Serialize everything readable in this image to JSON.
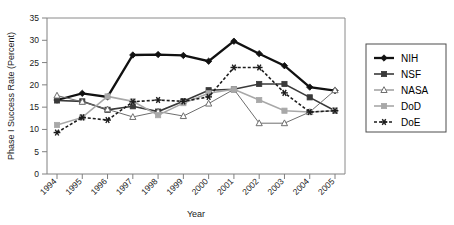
{
  "chart_data": {
    "type": "line",
    "title": "",
    "xlabel": "Year",
    "ylabel": "Phase I Success Rate (Percent)",
    "categories": [
      "1994",
      "1995",
      "1996",
      "1997",
      "1998",
      "1999",
      "2000",
      "2001",
      "2002",
      "2003",
      "2004",
      "2005"
    ],
    "x": [
      1994,
      1995,
      1996,
      1997,
      1998,
      1999,
      2000,
      2001,
      2002,
      2003,
      2004,
      2005
    ],
    "ylim": [
      0,
      35
    ],
    "yticks": [
      0,
      5,
      10,
      15,
      20,
      25,
      30,
      35
    ],
    "grid": false,
    "legend_position": "right",
    "series": [
      {
        "name": "NIH",
        "color": "#111111",
        "values": [
          16.6,
          18.1,
          17.3,
          26.7,
          26.8,
          26.6,
          25.3,
          29.8,
          27.0,
          24.3,
          19.5,
          18.7
        ]
      },
      {
        "name": "NSF",
        "color": "#3a3a3a",
        "values": [
          16.5,
          16.3,
          14.4,
          15.2,
          14.0,
          16.3,
          18.8,
          19.0,
          20.2,
          20.2,
          17.2,
          14.2
        ]
      },
      {
        "name": "NASA",
        "color": "#6e6e6e",
        "values": [
          17.6,
          16.2,
          14.5,
          12.8,
          14.0,
          13.0,
          15.8,
          19.0,
          11.4,
          11.4,
          13.9,
          18.8
        ]
      },
      {
        "name": "DoD",
        "color": "#a8a8a8",
        "values": [
          11.0,
          12.7,
          17.4,
          16.3,
          13.2,
          15.9,
          18.1,
          19.0,
          16.6,
          14.2,
          13.9,
          14.2
        ]
      },
      {
        "name": "DoE",
        "color": "#1c1c1c",
        "values": [
          9.3,
          12.7,
          12.1,
          16.2,
          16.6,
          16.3,
          17.3,
          23.9,
          23.9,
          18.2,
          13.9,
          14.2
        ]
      }
    ]
  },
  "legend": {
    "items": [
      {
        "label": "NIH"
      },
      {
        "label": "NSF"
      },
      {
        "label": "NASA"
      },
      {
        "label": "DoD"
      },
      {
        "label": "DoE"
      }
    ]
  }
}
